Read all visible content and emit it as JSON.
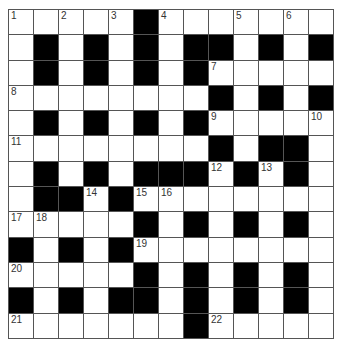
{
  "puzzle": {
    "type": "crossword",
    "rows": 13,
    "cols": 13,
    "colors": {
      "block": "#000000",
      "cell": "#ffffff",
      "line": "#555555"
    },
    "blacks": [
      [
        0,
        5
      ],
      [
        1,
        1
      ],
      [
        1,
        3
      ],
      [
        1,
        5
      ],
      [
        1,
        7
      ],
      [
        1,
        8
      ],
      [
        1,
        10
      ],
      [
        1,
        12
      ],
      [
        2,
        1
      ],
      [
        2,
        3
      ],
      [
        2,
        5
      ],
      [
        2,
        7
      ],
      [
        3,
        8
      ],
      [
        3,
        10
      ],
      [
        3,
        12
      ],
      [
        4,
        1
      ],
      [
        4,
        3
      ],
      [
        4,
        5
      ],
      [
        4,
        7
      ],
      [
        5,
        8
      ],
      [
        5,
        10
      ],
      [
        5,
        11
      ],
      [
        6,
        1
      ],
      [
        6,
        3
      ],
      [
        6,
        5
      ],
      [
        6,
        6
      ],
      [
        6,
        7
      ],
      [
        6,
        9
      ],
      [
        6,
        11
      ],
      [
        7,
        1
      ],
      [
        7,
        2
      ],
      [
        7,
        4
      ],
      [
        8,
        5
      ],
      [
        8,
        7
      ],
      [
        8,
        9
      ],
      [
        8,
        11
      ],
      [
        9,
        0
      ],
      [
        9,
        2
      ],
      [
        9,
        4
      ],
      [
        10,
        5
      ],
      [
        10,
        7
      ],
      [
        10,
        9
      ],
      [
        10,
        11
      ],
      [
        11,
        0
      ],
      [
        11,
        2
      ],
      [
        11,
        4
      ],
      [
        11,
        5
      ],
      [
        11,
        7
      ],
      [
        11,
        9
      ],
      [
        11,
        11
      ],
      [
        12,
        7
      ]
    ],
    "numbers": [
      {
        "r": 0,
        "c": 0,
        "n": "1"
      },
      {
        "r": 0,
        "c": 2,
        "n": "2"
      },
      {
        "r": 0,
        "c": 4,
        "n": "3"
      },
      {
        "r": 0,
        "c": 6,
        "n": "4"
      },
      {
        "r": 0,
        "c": 9,
        "n": "5"
      },
      {
        "r": 0,
        "c": 11,
        "n": "6"
      },
      {
        "r": 2,
        "c": 8,
        "n": "7"
      },
      {
        "r": 3,
        "c": 0,
        "n": "8"
      },
      {
        "r": 4,
        "c": 8,
        "n": "9"
      },
      {
        "r": 4,
        "c": 12,
        "n": "10"
      },
      {
        "r": 5,
        "c": 0,
        "n": "11"
      },
      {
        "r": 6,
        "c": 8,
        "n": "12"
      },
      {
        "r": 6,
        "c": 10,
        "n": "13"
      },
      {
        "r": 7,
        "c": 3,
        "n": "14"
      },
      {
        "r": 7,
        "c": 5,
        "n": "15"
      },
      {
        "r": 7,
        "c": 6,
        "n": "16"
      },
      {
        "r": 8,
        "c": 0,
        "n": "17"
      },
      {
        "r": 8,
        "c": 1,
        "n": "18"
      },
      {
        "r": 9,
        "c": 5,
        "n": "19"
      },
      {
        "r": 10,
        "c": 0,
        "n": "20"
      },
      {
        "r": 12,
        "c": 0,
        "n": "21"
      },
      {
        "r": 12,
        "c": 8,
        "n": "22"
      }
    ]
  }
}
